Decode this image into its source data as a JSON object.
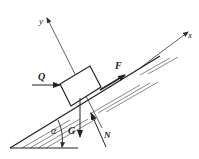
{
  "diagram": {
    "labels": {
      "x_axis": "x",
      "y_axis": "y",
      "push_force": "Q",
      "friction_force": "F",
      "gravity": "G",
      "normal_force": "N",
      "angle": "α"
    },
    "colors": {
      "line": "#222222",
      "background": "#ffffff"
    }
  }
}
